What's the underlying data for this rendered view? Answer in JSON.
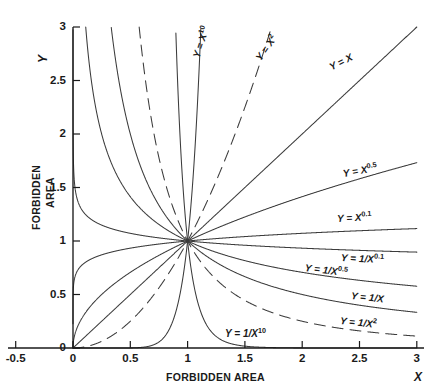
{
  "chart_data": {
    "type": "line",
    "title": "",
    "xlabel": "X",
    "ylabel": "Y",
    "xlim": [
      -0.5,
      3
    ],
    "ylim": [
      0,
      3
    ],
    "grid": false,
    "legend": "inline-annotations",
    "xticks": [
      "-0.5",
      "0",
      "0.5",
      "1",
      "1.5",
      "2",
      "2.5",
      "3"
    ],
    "xtick_values": [
      -0.5,
      0,
      0.5,
      1,
      1.5,
      2,
      2.5,
      3
    ],
    "yticks": [
      "0",
      "0.5",
      "1",
      "1.5",
      "2",
      "2.5",
      "3"
    ],
    "ytick_values": [
      0,
      0.5,
      1,
      1.5,
      2,
      2.5,
      3
    ],
    "annotations": [
      {
        "text": "FORBIDDEN AREA",
        "axis": "x",
        "note": "region X < 0"
      },
      {
        "text": "FORBIDDEN AREA",
        "axis": "y",
        "note": "region Y < 0"
      }
    ],
    "common_point": [
      1,
      1
    ],
    "series": [
      {
        "name": "Y = X^10",
        "exponent": 10,
        "style": "solid",
        "label": "Y = X",
        "label_sup": "10"
      },
      {
        "name": "Y = X^2",
        "exponent": 2,
        "style": "dashed",
        "label": "Y = X",
        "label_sup": "2"
      },
      {
        "name": "Y = X",
        "exponent": 1,
        "style": "solid",
        "label": "Y = X",
        "label_sup": ""
      },
      {
        "name": "Y = X^0.5",
        "exponent": 0.5,
        "style": "solid",
        "label": "Y = X",
        "label_sup": "0.5"
      },
      {
        "name": "Y = X^0.1",
        "exponent": 0.1,
        "style": "solid",
        "label": "Y = X",
        "label_sup": "0.1"
      },
      {
        "name": "Y = 1/X^0.1",
        "exponent": -0.1,
        "style": "solid",
        "label": "Y = 1/X",
        "label_sup": "0.1"
      },
      {
        "name": "Y = 1/X^0.5",
        "exponent": -0.5,
        "style": "solid",
        "label": "Y = 1/X",
        "label_sup": "0.5"
      },
      {
        "name": "Y = 1/X",
        "exponent": -1,
        "style": "solid",
        "label": "Y = 1/X",
        "label_sup": ""
      },
      {
        "name": "Y = 1/X^2",
        "exponent": -2,
        "style": "dashed",
        "label": "Y = 1/X",
        "label_sup": "2"
      },
      {
        "name": "Y = 1/X^10",
        "exponent": -10,
        "style": "solid",
        "label": "Y = 1/X",
        "label_sup": "10"
      }
    ]
  },
  "axes": {
    "x_var": "X",
    "y_var": "Y",
    "x_forbidden": "FORBIDDEN AREA",
    "y_forbidden_line1": "FORBIDDEN",
    "y_forbidden_line2": "AREA"
  },
  "colors": {
    "axis": "#1a1a1a",
    "curve": "#3b3b3b",
    "background": "#ffffff",
    "text": "#1a1a1a"
  }
}
